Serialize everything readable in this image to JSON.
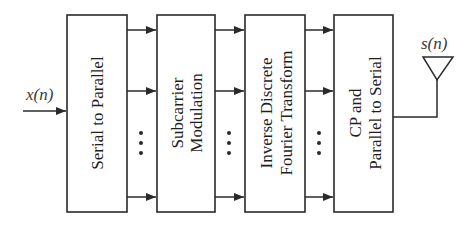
{
  "diagram": {
    "input_signal": "x(n)",
    "output_signal": "s(n)",
    "blocks": [
      {
        "id": "s2p",
        "lines": [
          "Serial to Parallel"
        ]
      },
      {
        "id": "mod",
        "lines": [
          "Subcarrier",
          "Modulation"
        ]
      },
      {
        "id": "idft",
        "lines": [
          "Inverse Discrete",
          "Fourier Transform"
        ]
      },
      {
        "id": "p2s",
        "lines": [
          "CP and",
          "Parallel to Serial"
        ]
      }
    ],
    "parallel_ellipsis": "…",
    "output_device": "antenna-icon"
  }
}
